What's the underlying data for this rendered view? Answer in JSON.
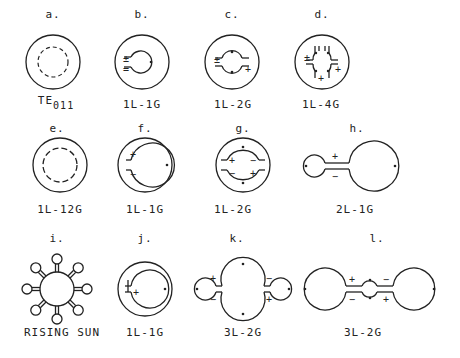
{
  "figure": {
    "panels": [
      {
        "id": "a",
        "letter": "a.",
        "caption": "TE",
        "caption_sub": "011",
        "shape": "concentric circle with dashed inner ring"
      },
      {
        "id": "b",
        "letter": "b.",
        "caption": "1L-1G",
        "shape": "ring with single inner loop-gap"
      },
      {
        "id": "c",
        "letter": "c.",
        "caption": "1L-2G",
        "shape": "ring with inner loop, two gaps"
      },
      {
        "id": "d",
        "letter": "d.",
        "caption": "1L-4G",
        "shape": "ring with inner loop, four gaps"
      },
      {
        "id": "e",
        "letter": "e.",
        "caption": "1L-12G",
        "shape": "ring with segmented inner loop"
      },
      {
        "id": "f",
        "letter": "f.",
        "caption": "1L-1G",
        "shape": "ring with large inner loop, one gap"
      },
      {
        "id": "g",
        "letter": "g.",
        "caption": "1L-2G",
        "shape": "ring with large inner loop, two gaps"
      },
      {
        "id": "h",
        "letter": "h.",
        "caption": "2L-1G",
        "shape": "two loops joined by one gap"
      },
      {
        "id": "i",
        "letter": "i.",
        "caption": "RISING SUN",
        "shape": "central loop with eight small loops"
      },
      {
        "id": "j",
        "letter": "j.",
        "caption": "1L-1G",
        "shape": "ring with inner loop, one gap"
      },
      {
        "id": "k",
        "letter": "k.",
        "caption": "3L-2G",
        "shape": "three loops, two gaps"
      },
      {
        "id": "l",
        "letter": "l.",
        "caption": "3L-2G",
        "shape": "three loops in series, two gaps"
      }
    ],
    "signs": {
      "plus": "+",
      "minus": "−",
      "plus_minus": "±"
    }
  }
}
